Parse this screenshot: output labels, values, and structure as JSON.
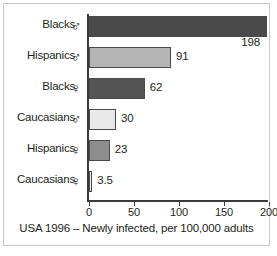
{
  "chart_data": {
    "type": "bar",
    "orientation": "horizontal",
    "title": "",
    "caption": "USA 1996 – Newly infected, per 100,000 adults",
    "xlabel": "",
    "ylabel": "",
    "xlim": [
      0,
      200
    ],
    "xticks": [
      0,
      50,
      100,
      150,
      200
    ],
    "xtick_labels": [
      "0",
      "50",
      "100",
      "150",
      "200"
    ],
    "grid": false,
    "legend": "none",
    "categories": [
      "Blacks",
      "Hispanics",
      "Blacks",
      "Caucasians",
      "Hispanics",
      "Caucasians"
    ],
    "group_symbols": [
      "♂",
      "♂",
      "♀",
      "♂",
      "♀",
      "♀"
    ],
    "group_symbol_names": [
      "male-symbol",
      "male-symbol",
      "female-symbol",
      "male-symbol",
      "female-symbol",
      "female-symbol"
    ],
    "values": [
      198,
      91,
      62,
      30,
      23,
      3.5
    ],
    "value_labels": [
      "198",
      "91",
      "62",
      "30",
      "23",
      "3.5"
    ],
    "bar_colors": [
      "#4a4a4a",
      "#b5b5b5",
      "#555555",
      "#e9e9e9",
      "#8d8d8d",
      "#f1f1f1"
    ],
    "bar_outline_color": "#4a4a4a"
  },
  "axis": {
    "line_color": "#3b3b3b"
  },
  "frame": {
    "border_color": "#c9c9c9",
    "background": "#ffffff"
  }
}
